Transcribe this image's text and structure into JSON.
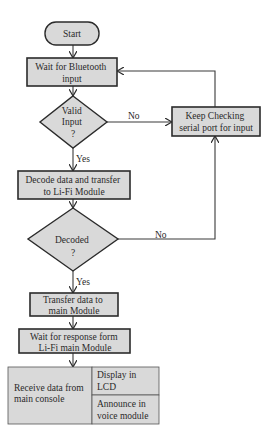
{
  "diagram": {
    "colors": {
      "fill": "#d9d9d9",
      "stroke": "#2b2b2b",
      "line": "#3a3a3a",
      "background": "#ffffff"
    },
    "nodes": {
      "start": {
        "lines": [
          "Start"
        ]
      },
      "wait_bt": {
        "lines": [
          "Wait for Bluetooth",
          "input"
        ]
      },
      "valid": {
        "lines": [
          "Valid",
          "Input",
          "?"
        ]
      },
      "keep_checking": {
        "lines": [
          "Keep Checking",
          "serial port for input"
        ]
      },
      "decode": {
        "lines": [
          "Decode data and transfer",
          "to Li-Fi Module"
        ]
      },
      "decoded": {
        "lines": [
          "Decoded",
          "?"
        ]
      },
      "transfer": {
        "lines": [
          "Transfer data to",
          "main Module"
        ]
      },
      "wait_resp": {
        "lines": [
          "Wait for response form",
          "Li-Fi main Module"
        ]
      },
      "receive": {
        "lines": [
          "Receive data from",
          "main console"
        ]
      },
      "display": {
        "lines": [
          "Display in",
          "LCD"
        ]
      },
      "announce": {
        "lines": [
          "Announce in",
          "voice module"
        ]
      }
    },
    "edge_labels": {
      "valid_no": "No",
      "valid_yes": "Yes",
      "decoded_no": "No",
      "decoded_yes": "Yes"
    }
  }
}
